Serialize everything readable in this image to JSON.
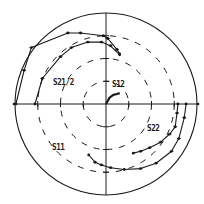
{
  "chart_data": {
    "type": "polar",
    "title": "",
    "center_px": [
      106,
      104
    ],
    "outer_radius_px": 91,
    "grid": {
      "outer_circle": 1.0,
      "dashed_circles": [
        0.25,
        0.5,
        0.75
      ],
      "axes": [
        "horizontal",
        "vertical"
      ],
      "axis_ticks": [
        0.25,
        0.5,
        0.75
      ]
    },
    "colors": {
      "ink": "#1a1a1a",
      "background": "#ffffff"
    },
    "series": [
      {
        "name": "S21/2",
        "trace": "outer",
        "points": [
          [
            -0.99,
            0.0
          ],
          [
            -0.9,
            0.37
          ],
          [
            -0.82,
            0.62
          ],
          [
            -0.42,
            0.78
          ],
          [
            -0.28,
            0.78
          ],
          [
            -0.03,
            0.75
          ],
          [
            0.02,
            0.72
          ],
          [
            0.12,
            0.6
          ],
          [
            0.15,
            0.55
          ]
        ]
      },
      {
        "name": "S21/2",
        "trace": "inner",
        "points": [
          [
            -0.78,
            0.0
          ],
          [
            -0.7,
            0.28
          ],
          [
            -0.5,
            0.52
          ],
          [
            -0.38,
            0.62
          ],
          [
            -0.2,
            0.68
          ],
          [
            -0.05,
            0.68
          ],
          [
            0.05,
            0.64
          ],
          [
            0.15,
            0.54
          ]
        ]
      },
      {
        "name": "S12",
        "points": [
          [
            0.0,
            0.0
          ],
          [
            0.04,
            0.07
          ],
          [
            0.08,
            0.1
          ],
          [
            0.12,
            0.11
          ],
          [
            0.15,
            0.12
          ]
        ]
      },
      {
        "name": "S22",
        "points": [
          [
            0.79,
            0.0
          ],
          [
            0.78,
            -0.1
          ],
          [
            0.76,
            -0.25
          ],
          [
            0.7,
            -0.33
          ],
          [
            0.6,
            -0.42
          ],
          [
            0.48,
            -0.48
          ],
          [
            0.38,
            -0.52
          ],
          [
            0.3,
            -0.54
          ]
        ]
      },
      {
        "name": "S11",
        "points": [
          [
            -0.19,
            -0.56
          ],
          [
            -0.12,
            -0.64
          ],
          [
            -0.05,
            -0.67
          ],
          [
            0.05,
            -0.7
          ],
          [
            0.2,
            -0.72
          ],
          [
            0.38,
            -0.71
          ],
          [
            0.55,
            -0.65
          ],
          [
            0.72,
            -0.52
          ],
          [
            0.8,
            -0.38
          ],
          [
            0.86,
            -0.15
          ],
          [
            0.88,
            0.0
          ]
        ]
      }
    ],
    "labels": [
      {
        "text": "S21/2",
        "x": 0.39,
        "y": 0.4
      },
      {
        "text": "S12",
        "x": 0.57,
        "y": 0.4
      },
      {
        "text": "S22",
        "x": 0.73,
        "y": 0.61
      },
      {
        "text": "S11",
        "x": 0.24,
        "y": 0.71
      }
    ]
  }
}
